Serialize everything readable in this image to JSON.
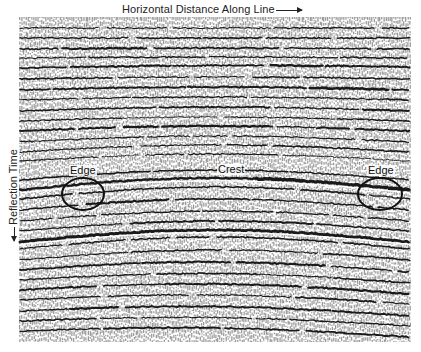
{
  "figure": {
    "x_axis_label": "Horizontal Distance Along Line",
    "y_axis_label": "Reflection Time",
    "annotations": [
      {
        "id": "edge-left",
        "label": "Edge",
        "x": 69,
        "y": 165
      },
      {
        "id": "crest",
        "label": "Crest",
        "x": 217,
        "y": 164
      },
      {
        "id": "edge-right",
        "label": "Edge",
        "x": 367,
        "y": 165
      }
    ],
    "ellipses": [
      {
        "id": "edge-left-circle",
        "cx": 83,
        "cy": 194,
        "rx": 21,
        "ry": 16
      },
      {
        "id": "edge-right-circle",
        "cx": 380,
        "cy": 194,
        "rx": 22,
        "ry": 16
      }
    ]
  },
  "section": {
    "bounds": {
      "left": 20,
      "top": 17,
      "right": 410,
      "bottom": 342
    },
    "trace_spacing": 2,
    "colors": {
      "ink": "#1a1a1a",
      "paper": "#ffffff"
    },
    "horizons": [
      {
        "y": 28,
        "arch": 0,
        "tilt": 0,
        "w": 1.2
      },
      {
        "y": 38,
        "arch": 0,
        "tilt": 0,
        "w": 1.4
      },
      {
        "y": 49,
        "arch": 1,
        "tilt": 0,
        "w": 1.8
      },
      {
        "y": 58,
        "arch": 1,
        "tilt": 0,
        "w": 1.3
      },
      {
        "y": 68,
        "arch": 2,
        "tilt": -1,
        "w": 2.0
      },
      {
        "y": 79,
        "arch": 2,
        "tilt": 0,
        "w": 1.5
      },
      {
        "y": 90,
        "arch": 3,
        "tilt": 0,
        "w": 2.2
      },
      {
        "y": 100,
        "arch": 3,
        "tilt": 0,
        "w": 1.4
      },
      {
        "y": 111,
        "arch": 4,
        "tilt": 0,
        "w": 1.8
      },
      {
        "y": 121,
        "arch": 4,
        "tilt": 0,
        "w": 1.3
      },
      {
        "y": 131,
        "arch": 5,
        "tilt": 0,
        "w": 1.9
      },
      {
        "y": 142,
        "arch": 6,
        "tilt": 0,
        "w": 1.4
      },
      {
        "y": 152,
        "arch": 7,
        "tilt": 0,
        "w": 1.6
      },
      {
        "y": 161,
        "arch": 7,
        "tilt": 0,
        "w": 1.2
      },
      {
        "y": 180,
        "arch": 10,
        "tilt": 0,
        "w": 1.6
      },
      {
        "y": 190,
        "arch": 12,
        "tilt": 0,
        "w": 3.2
      },
      {
        "y": 199,
        "arch": 12,
        "tilt": 0,
        "w": 1.6
      },
      {
        "y": 210,
        "arch": 11,
        "tilt": 0,
        "w": 1.8
      },
      {
        "y": 221,
        "arch": 10,
        "tilt": 0,
        "w": 1.4
      },
      {
        "y": 231,
        "arch": 10,
        "tilt": 0,
        "w": 1.7
      },
      {
        "y": 242,
        "arch": 12,
        "tilt": 0,
        "w": 2.8
      },
      {
        "y": 249,
        "arch": 12,
        "tilt": 0,
        "w": 1.6
      },
      {
        "y": 260,
        "arch": 10,
        "tilt": 0,
        "w": 1.5
      },
      {
        "y": 270,
        "arch": 9,
        "tilt": 2,
        "w": 1.8
      },
      {
        "y": 280,
        "arch": 8,
        "tilt": 3,
        "w": 1.4
      },
      {
        "y": 290,
        "arch": 8,
        "tilt": 4,
        "w": 2.0
      },
      {
        "y": 300,
        "arch": 7,
        "tilt": 4,
        "w": 1.5
      },
      {
        "y": 311,
        "arch": 7,
        "tilt": 5,
        "w": 1.9
      },
      {
        "y": 321,
        "arch": 6,
        "tilt": 5,
        "w": 1.4
      },
      {
        "y": 331,
        "arch": 6,
        "tilt": 6,
        "w": 1.8
      }
    ]
  }
}
